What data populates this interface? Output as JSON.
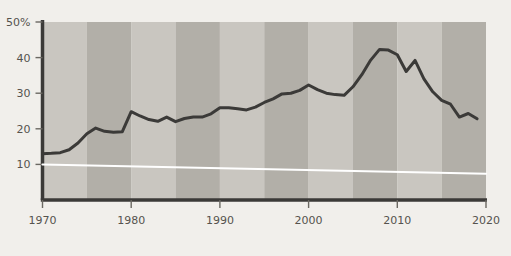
{
  "chart_data": {
    "type": "line",
    "title": "",
    "subtitle": "",
    "xlabel": "",
    "ylabel": "",
    "xlim": [
      1970,
      2020
    ],
    "ylim": [
      0,
      50
    ],
    "grid": false,
    "legend": null,
    "y_ticks": [
      {
        "value": 50,
        "label": "50%"
      },
      {
        "value": 40,
        "label": "40"
      },
      {
        "value": 30,
        "label": "30"
      },
      {
        "value": 20,
        "label": "20"
      },
      {
        "value": 10,
        "label": "10"
      }
    ],
    "x_ticks": [
      {
        "value": 1970,
        "label": "1970"
      },
      {
        "value": 1980,
        "label": "1980"
      },
      {
        "value": 1990,
        "label": "1990"
      },
      {
        "value": 2000,
        "label": "2000"
      },
      {
        "value": 2010,
        "label": "2010"
      },
      {
        "value": 2020,
        "label": "2020"
      }
    ],
    "series": [
      {
        "name": "main-series",
        "color": "#3b3a38",
        "width": 3,
        "x": [
          1970,
          1971,
          1972,
          1973,
          1974,
          1975,
          1976,
          1977,
          1978,
          1979,
          1980,
          1981,
          1982,
          1983,
          1984,
          1985,
          1986,
          1987,
          1988,
          1989,
          1990,
          1991,
          1992,
          1993,
          1994,
          1995,
          1996,
          1997,
          1998,
          1999,
          2000,
          2001,
          2002,
          2003,
          2004,
          2005,
          2006,
          2007,
          2008,
          2009,
          2010,
          2011,
          2012,
          2013,
          2014,
          2015,
          2016,
          2017,
          2018,
          2019
        ],
        "values": [
          13.0,
          13.1,
          13.3,
          14.1,
          16.0,
          18.6,
          20.2,
          19.3,
          19.0,
          19.2,
          24.8,
          23.6,
          22.6,
          22.1,
          23.3,
          22.0,
          22.9,
          23.3,
          23.3,
          24.2,
          25.9,
          25.9,
          25.6,
          25.3,
          26.1,
          27.4,
          28.4,
          29.8,
          30.0,
          30.8,
          32.3,
          31.0,
          30.0,
          29.6,
          29.4,
          31.8,
          35.2,
          39.3,
          42.3,
          42.1,
          40.8,
          36.1,
          39.2,
          34.0,
          30.4,
          28.0,
          26.9,
          23.3,
          24.3,
          22.8
        ]
      },
      {
        "name": "reference-line",
        "color": "#ffffff",
        "width": 2,
        "x": [
          1970,
          2020
        ],
        "values": [
          10.0,
          7.4
        ]
      }
    ],
    "background_bands": {
      "note": "alternating vertical 5-year shading bands",
      "light_color": "#c9c6c0",
      "dark_color": "#b2afa8",
      "band_years": 5,
      "start_year": 1970,
      "end_year": 2020
    },
    "axis_color": "#3b3a38",
    "plot_background": "#c9c6c0",
    "page_background": "#f1efeb"
  }
}
